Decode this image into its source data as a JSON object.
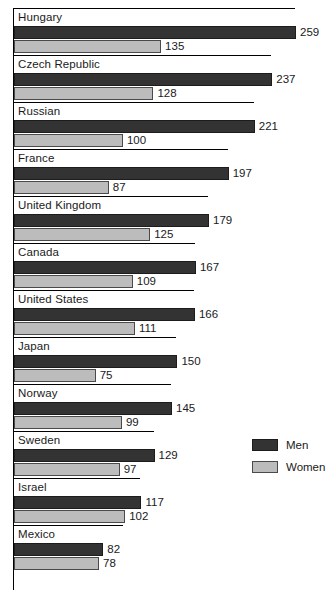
{
  "chart_data": {
    "type": "bar",
    "orientation": "horizontal",
    "title": "",
    "subtitle": "",
    "xlabel": "",
    "ylabel": "",
    "grid": false,
    "legend_position": "right",
    "axis_origin_value": 0,
    "xlim": [
      0,
      290
    ],
    "categories": [
      "Hungary",
      "Czech Republic",
      "Russian",
      "France",
      "United Kingdom",
      "Canada",
      "United States",
      "Japan",
      "Norway",
      "Sweden",
      "Israel",
      "Mexico"
    ],
    "series": [
      {
        "name": "Men",
        "color": "#333333",
        "values": [
          259,
          237,
          221,
          197,
          179,
          167,
          166,
          150,
          145,
          129,
          117,
          82
        ]
      },
      {
        "name": "Women",
        "color": "#bcbcbc",
        "values": [
          135,
          128,
          100,
          87,
          125,
          109,
          111,
          75,
          99,
          97,
          102,
          78
        ]
      }
    ]
  },
  "legend": {
    "items": [
      {
        "label": "Men",
        "swatch": "men"
      },
      {
        "label": "Women",
        "swatch": "women"
      }
    ]
  }
}
